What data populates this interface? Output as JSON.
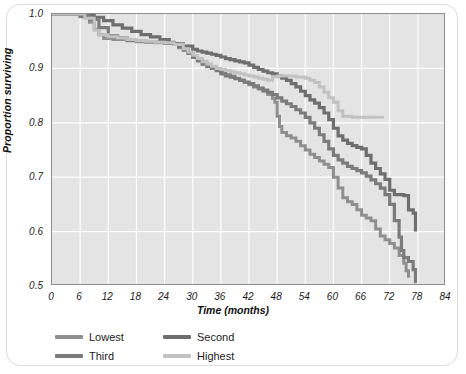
{
  "figure": {
    "card_background": "#ffffff",
    "plot_background": "#e4e4e4",
    "gridline_color": "#ffffff",
    "axis_color": "#8e8e8e",
    "top_cropped_text": ""
  },
  "chart_data": {
    "type": "line",
    "subtype": "kaplan-meier-step",
    "title": "",
    "xlabel": "Time (months)",
    "ylabel": "Proportion surviving",
    "xlim": [
      0,
      84
    ],
    "ylim": [
      0.5,
      1.0
    ],
    "xticks": [
      0,
      6,
      12,
      18,
      24,
      30,
      36,
      42,
      48,
      54,
      60,
      66,
      72,
      78,
      84
    ],
    "xtick_labels": [
      "0",
      "6",
      "12",
      "18",
      "24",
      "30",
      "36",
      "42",
      "48",
      "54",
      "60",
      "66",
      "72",
      "78",
      "84"
    ],
    "yticks": [
      0.5,
      0.6,
      0.7,
      0.8,
      0.9,
      1.0
    ],
    "ytick_labels": [
      "0.5",
      "0.6",
      "0.7",
      "0.8",
      "0.9",
      "1.0"
    ],
    "grid": true,
    "grid_axis": "both",
    "legend_position": "below-left",
    "legend_columns": 2,
    "series": [
      {
        "name": "Lowest",
        "color": "#8f8f8f",
        "linewidth": 3,
        "points": [
          [
            0,
            1.0
          ],
          [
            4,
            1.0
          ],
          [
            6,
            0.995
          ],
          [
            8,
            0.985
          ],
          [
            9,
            0.972
          ],
          [
            10,
            0.962
          ],
          [
            11,
            0.955
          ],
          [
            13,
            0.953
          ],
          [
            16,
            0.951
          ],
          [
            18,
            0.949
          ],
          [
            20,
            0.948
          ],
          [
            22,
            0.947
          ],
          [
            24,
            0.946
          ],
          [
            26,
            0.944
          ],
          [
            27,
            0.938
          ],
          [
            28,
            0.933
          ],
          [
            29,
            0.928
          ],
          [
            30,
            0.921
          ],
          [
            31,
            0.916
          ],
          [
            32,
            0.912
          ],
          [
            33,
            0.907
          ],
          [
            34,
            0.902
          ],
          [
            35,
            0.898
          ],
          [
            36,
            0.893
          ],
          [
            37,
            0.889
          ],
          [
            38,
            0.886
          ],
          [
            39,
            0.882
          ],
          [
            40,
            0.878
          ],
          [
            41,
            0.874
          ],
          [
            42,
            0.87
          ],
          [
            43,
            0.866
          ],
          [
            44,
            0.862
          ],
          [
            45,
            0.858
          ],
          [
            46,
            0.852
          ],
          [
            47,
            0.845
          ],
          [
            47.5,
            0.838
          ],
          [
            48,
            0.812
          ],
          [
            48.5,
            0.793
          ],
          [
            49,
            0.782
          ],
          [
            50,
            0.776
          ],
          [
            51,
            0.772
          ],
          [
            52,
            0.766
          ],
          [
            53,
            0.758
          ],
          [
            54,
            0.75
          ],
          [
            55,
            0.742
          ],
          [
            56,
            0.736
          ],
          [
            57,
            0.73
          ],
          [
            58,
            0.724
          ],
          [
            59,
            0.718
          ],
          [
            60,
            0.7
          ],
          [
            61,
            0.68
          ],
          [
            62,
            0.662
          ],
          [
            63,
            0.655
          ],
          [
            64,
            0.65
          ],
          [
            65,
            0.64
          ],
          [
            66,
            0.63
          ],
          [
            67,
            0.625
          ],
          [
            68,
            0.62
          ],
          [
            69,
            0.605
          ],
          [
            70,
            0.592
          ],
          [
            71,
            0.585
          ],
          [
            72,
            0.578
          ],
          [
            73,
            0.57
          ],
          [
            74,
            0.556
          ],
          [
            75,
            0.542
          ],
          [
            75.5,
            0.528
          ],
          [
            76,
            0.515
          ]
        ]
      },
      {
        "name": "Second",
        "color": "#6e6e6e",
        "linewidth": 3.2,
        "points": [
          [
            0,
            1.0
          ],
          [
            5,
            1.0
          ],
          [
            7,
            0.998
          ],
          [
            9,
            0.994
          ],
          [
            11,
            0.988
          ],
          [
            13,
            0.98
          ],
          [
            15,
            0.974
          ],
          [
            17,
            0.968
          ],
          [
            19,
            0.962
          ],
          [
            21,
            0.958
          ],
          [
            23,
            0.953
          ],
          [
            25,
            0.948
          ],
          [
            26,
            0.945
          ],
          [
            28,
            0.941
          ],
          [
            30,
            0.935
          ],
          [
            31,
            0.932
          ],
          [
            32,
            0.93
          ],
          [
            33,
            0.928
          ],
          [
            34,
            0.926
          ],
          [
            35,
            0.924
          ],
          [
            36,
            0.921
          ],
          [
            37,
            0.918
          ],
          [
            38,
            0.916
          ],
          [
            39,
            0.914
          ],
          [
            40,
            0.912
          ],
          [
            41,
            0.91
          ],
          [
            42,
            0.906
          ],
          [
            43,
            0.902
          ],
          [
            44,
            0.898
          ],
          [
            45,
            0.895
          ],
          [
            46,
            0.892
          ],
          [
            47,
            0.89
          ],
          [
            48,
            0.886
          ],
          [
            49,
            0.882
          ],
          [
            50,
            0.878
          ],
          [
            51,
            0.872
          ],
          [
            52,
            0.866
          ],
          [
            53,
            0.858
          ],
          [
            54,
            0.85
          ],
          [
            55,
            0.842
          ],
          [
            56,
            0.836
          ],
          [
            57,
            0.828
          ],
          [
            58,
            0.818
          ],
          [
            59,
            0.806
          ],
          [
            60,
            0.79
          ],
          [
            61,
            0.776
          ],
          [
            62,
            0.768
          ],
          [
            63,
            0.762
          ],
          [
            64,
            0.758
          ],
          [
            65,
            0.755
          ],
          [
            66,
            0.752
          ],
          [
            67,
            0.74
          ],
          [
            68,
            0.726
          ],
          [
            69,
            0.716
          ],
          [
            70,
            0.706
          ],
          [
            71,
            0.696
          ],
          [
            72,
            0.676
          ],
          [
            73,
            0.668
          ],
          [
            75,
            0.666
          ],
          [
            76,
            0.64
          ],
          [
            77,
            0.634
          ],
          [
            77.5,
            0.6
          ]
        ]
      },
      {
        "name": "Third",
        "color": "#7b7b7b",
        "linewidth": 3.2,
        "points": [
          [
            0,
            1.0
          ],
          [
            4,
            1.0
          ],
          [
            6,
            0.996
          ],
          [
            8,
            0.99
          ],
          [
            10,
            0.975
          ],
          [
            12,
            0.96
          ],
          [
            14,
            0.956
          ],
          [
            16,
            0.952
          ],
          [
            18,
            0.95
          ],
          [
            20,
            0.949
          ],
          [
            22,
            0.948
          ],
          [
            24,
            0.947
          ],
          [
            26,
            0.945
          ],
          [
            27,
            0.94
          ],
          [
            28,
            0.935
          ],
          [
            29,
            0.928
          ],
          [
            30,
            0.92
          ],
          [
            31,
            0.914
          ],
          [
            32,
            0.908
          ],
          [
            33,
            0.903
          ],
          [
            34,
            0.9
          ],
          [
            35,
            0.896
          ],
          [
            36,
            0.89
          ],
          [
            37,
            0.886
          ],
          [
            38,
            0.884
          ],
          [
            39,
            0.881
          ],
          [
            40,
            0.878
          ],
          [
            41,
            0.875
          ],
          [
            42,
            0.872
          ],
          [
            43,
            0.868
          ],
          [
            44,
            0.864
          ],
          [
            45,
            0.86
          ],
          [
            46,
            0.856
          ],
          [
            47,
            0.852
          ],
          [
            48,
            0.846
          ],
          [
            49,
            0.84
          ],
          [
            50,
            0.835
          ],
          [
            51,
            0.83
          ],
          [
            52,
            0.824
          ],
          [
            53,
            0.818
          ],
          [
            54,
            0.81
          ],
          [
            55,
            0.8
          ],
          [
            56,
            0.79
          ],
          [
            57,
            0.778
          ],
          [
            58,
            0.766
          ],
          [
            59,
            0.752
          ],
          [
            60,
            0.74
          ],
          [
            61,
            0.732
          ],
          [
            62,
            0.726
          ],
          [
            63,
            0.72
          ],
          [
            64,
            0.716
          ],
          [
            65,
            0.712
          ],
          [
            66,
            0.708
          ],
          [
            67,
            0.702
          ],
          [
            68,
            0.695
          ],
          [
            69,
            0.688
          ],
          [
            70,
            0.68
          ],
          [
            71,
            0.668
          ],
          [
            72,
            0.65
          ],
          [
            73,
            0.62
          ],
          [
            74,
            0.59
          ],
          [
            74.5,
            0.565
          ],
          [
            75,
            0.552
          ],
          [
            76,
            0.545
          ],
          [
            77,
            0.53
          ],
          [
            77.5,
            0.505
          ]
        ]
      },
      {
        "name": "Highest",
        "color": "#c2c2c2",
        "linewidth": 3,
        "points": [
          [
            0,
            1.0
          ],
          [
            5,
            1.0
          ],
          [
            7,
            0.992
          ],
          [
            9,
            0.97
          ],
          [
            10,
            0.962
          ],
          [
            12,
            0.958
          ],
          [
            14,
            0.956
          ],
          [
            16,
            0.953
          ],
          [
            18,
            0.951
          ],
          [
            20,
            0.95
          ],
          [
            22,
            0.948
          ],
          [
            24,
            0.947
          ],
          [
            26,
            0.944
          ],
          [
            28,
            0.936
          ],
          [
            29,
            0.93
          ],
          [
            30,
            0.924
          ],
          [
            31,
            0.918
          ],
          [
            32,
            0.912
          ],
          [
            33,
            0.908
          ],
          [
            34,
            0.904
          ],
          [
            35,
            0.9
          ],
          [
            36,
            0.898
          ],
          [
            37,
            0.896
          ],
          [
            38,
            0.894
          ],
          [
            39,
            0.892
          ],
          [
            40,
            0.89
          ],
          [
            41,
            0.888
          ],
          [
            42,
            0.886
          ],
          [
            43,
            0.884
          ],
          [
            44,
            0.882
          ],
          [
            45,
            0.88
          ],
          [
            46,
            0.878
          ],
          [
            47,
            0.884
          ],
          [
            48,
            0.886
          ],
          [
            50,
            0.886
          ],
          [
            52,
            0.884
          ],
          [
            54,
            0.882
          ],
          [
            55,
            0.878
          ],
          [
            56,
            0.874
          ],
          [
            57,
            0.866
          ],
          [
            58,
            0.856
          ],
          [
            59,
            0.846
          ],
          [
            60,
            0.838
          ],
          [
            61,
            0.822
          ],
          [
            62,
            0.812
          ],
          [
            64,
            0.81
          ],
          [
            66,
            0.81
          ],
          [
            68,
            0.81
          ],
          [
            70,
            0.81
          ],
          [
            70.5,
            0.808
          ]
        ]
      }
    ]
  },
  "legend": {
    "items": [
      {
        "label": "Lowest",
        "color": "#8f8f8f"
      },
      {
        "label": "Second",
        "color": "#6e6e6e"
      },
      {
        "label": "Third",
        "color": "#7b7b7b"
      },
      {
        "label": "Highest",
        "color": "#c2c2c2"
      }
    ]
  }
}
